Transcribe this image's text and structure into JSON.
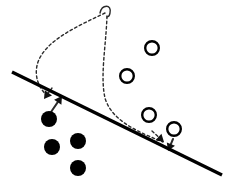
{
  "figure": {
    "width": 231,
    "height": 193,
    "background_color": "#ffffff",
    "stroke_color": "#111111",
    "dash_color": "#2b2b2b"
  },
  "chart_data": {
    "type": "scatter",
    "title": "",
    "xlabel": "",
    "ylabel": "",
    "xlim": [
      0,
      231
    ],
    "ylim": [
      0,
      193
    ],
    "grid": false,
    "legend": "none",
    "coordinate_system": "pixel (y increases downward)",
    "series": [
      {
        "name": "filled-class",
        "marker": "filled-circle",
        "color": "#000000",
        "radius": 8,
        "points": [
          {
            "x": 49,
            "y": 119
          },
          {
            "x": 52,
            "y": 147
          },
          {
            "x": 78,
            "y": 141
          },
          {
            "x": 78,
            "y": 168
          }
        ]
      },
      {
        "name": "open-class",
        "marker": "open-circle",
        "color": "#000000",
        "radius": 8,
        "stroke_width": 2.4,
        "points": [
          {
            "x": 152,
            "y": 48
          },
          {
            "x": 127,
            "y": 76
          },
          {
            "x": 149,
            "y": 115
          },
          {
            "x": 174,
            "y": 129
          }
        ]
      }
    ],
    "lines": [
      {
        "name": "decision-boundary",
        "style": "solid",
        "width": 3.4,
        "color": "#000000",
        "from": {
          "x": 12,
          "y": 72
        },
        "to": {
          "x": 222,
          "y": 175
        }
      }
    ],
    "curves": [
      {
        "name": "left-dashed-curve",
        "style": "dashed",
        "width": 1.4,
        "color": "#2b2b2b",
        "description": "sweeps from top cusp leftward and down to arrowhead above left filled dot",
        "path": "M 105 13 C 78 26 46 40 38 62 C 33 77 40 88 46 95"
      },
      {
        "name": "right-dashed-curve",
        "style": "dashed",
        "width": 1.4,
        "color": "#2b2b2b",
        "description": "descends from top cusp, bows left then right down to arrowhead near bottom-right open circle",
        "path": "M 107 16 C 106 46 100 76 105 98 C 112 122 141 133 163 142"
      },
      {
        "name": "top-cusp-hook",
        "style": "solid-thin",
        "width": 1.4,
        "color": "#2b2b2b",
        "description": "small hook joining the two dashed curves at the apex",
        "path": "M 100 13 C 102 4 112 4 110 13 C 109 18 108 16 107 17"
      }
    ],
    "arrows": [
      {
        "name": "left-dashed-arrowhead",
        "from": {
          "x": 52,
          "y": 88
        },
        "to": {
          "x": 44,
          "y": 99
        },
        "head": "filled-triangle",
        "style": "dashed"
      },
      {
        "name": "left-dot-arrow",
        "from": {
          "x": 51,
          "y": 112
        },
        "to": {
          "x": 62,
          "y": 96
        },
        "head": "filled-triangle",
        "style": "solid"
      },
      {
        "name": "right-dashed-arrowhead",
        "from": {
          "x": 152,
          "y": 131
        },
        "to": {
          "x": 164,
          "y": 142
        },
        "head": "filled-triangle",
        "style": "dashed"
      },
      {
        "name": "right-circle-arrow",
        "from": {
          "x": 173,
          "y": 139
        },
        "to": {
          "x": 168,
          "y": 151
        },
        "head": "filled-triangle",
        "style": "solid"
      }
    ],
    "annotations": []
  }
}
